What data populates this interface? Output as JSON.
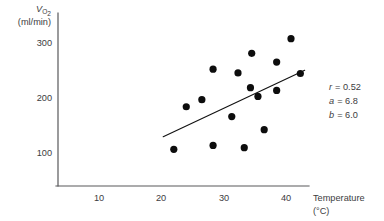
{
  "chart_data": {
    "type": "scatter",
    "title": "",
    "xlabel": "Temperature (°C)",
    "ylabel": "VO2 (ml/min)",
    "ylabel_main": "V",
    "ylabel_main_sub": "O",
    "ylabel_main_sub2": "2",
    "ylabel_units": "(ml/min)",
    "xlabel_main": "Temperature",
    "xlabel_units": "(°C)",
    "xlim": [
      5,
      45
    ],
    "ylim": [
      55,
      330
    ],
    "xticks": [
      10,
      20,
      30,
      40
    ],
    "xtick_labels": [
      "10",
      "20",
      "30",
      "40"
    ],
    "yticks": [
      100,
      200,
      300
    ],
    "ytick_labels": [
      "100",
      "200",
      "300"
    ],
    "grid": false,
    "legend": "none",
    "point_color": "#0d0d0d",
    "line_color": "#111111",
    "axis_color": "#58585a",
    "x": [
      22.0,
      24.0,
      26.5,
      28.3,
      28.3,
      31.3,
      32.3,
      33.3,
      34.3,
      34.5,
      35.5,
      36.5,
      38.5,
      38.5,
      40.8,
      42.3
    ],
    "y": [
      105,
      183,
      196,
      252,
      112,
      165,
      245,
      108,
      218,
      281,
      202,
      141,
      213,
      265,
      308,
      244
    ],
    "points": [
      {
        "x": 22.0,
        "y": 105
      },
      {
        "x": 24.0,
        "y": 183
      },
      {
        "x": 26.5,
        "y": 196
      },
      {
        "x": 28.3,
        "y": 252
      },
      {
        "x": 28.3,
        "y": 112
      },
      {
        "x": 31.3,
        "y": 165
      },
      {
        "x": 32.3,
        "y": 245
      },
      {
        "x": 33.3,
        "y": 108
      },
      {
        "x": 34.3,
        "y": 218
      },
      {
        "x": 34.5,
        "y": 281
      },
      {
        "x": 35.5,
        "y": 202
      },
      {
        "x": 36.5,
        "y": 141
      },
      {
        "x": 38.5,
        "y": 213
      },
      {
        "x": 38.5,
        "y": 265
      },
      {
        "x": 40.8,
        "y": 308
      },
      {
        "x": 42.3,
        "y": 244
      }
    ],
    "regression_line": {
      "x_start": 20.3,
      "y_start": 128,
      "x_end": 43.0,
      "y_end": 250
    },
    "annotations": {
      "r_var": "r",
      "r_value": "= 0.52",
      "a_var": "a",
      "a_value": "= 6.8",
      "b_var": "b",
      "b_value": "= 6.0"
    }
  }
}
